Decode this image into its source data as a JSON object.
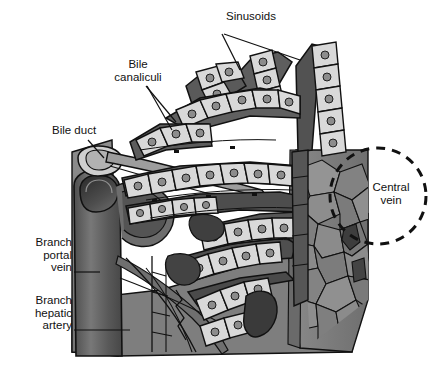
{
  "figure": {
    "type": "anatomical-diagram",
    "style": "grayscale line illustration",
    "background_color": "#ffffff"
  },
  "palette": {
    "background": "#ffffff",
    "outline": "#111111",
    "hepatocyte_fill": "#d9d9d9",
    "hepatocyte_nucleus": "#8f8f8f",
    "sinusoid_dark": "#5f5f5f",
    "sinusoid_darker": "#3f3f3f",
    "vessel_dark": "#4a4a4a",
    "vessel_mid": "#6e6e6e",
    "vessel_light": "#9a9a9a",
    "cut_face_gray": "#878787",
    "top_face_gray": "#a5a5a5",
    "bile_duct_fill": "#c9c9c9",
    "label_text": "#111111"
  },
  "labels": [
    {
      "id": "sinusoids",
      "text": "Sinusoids",
      "align": "center",
      "leaders": 2,
      "points_to": "dark channels between hepatocyte plates, upper right"
    },
    {
      "id": "bile-canaliculi",
      "text": "Bile\ncanaliculi",
      "align": "center",
      "leaders": 2,
      "points_to": "thin grooves between hepatocyte rows, upper middle"
    },
    {
      "id": "bile-duct",
      "text": "Bile duct",
      "align": "left",
      "leaders": 1,
      "points_to": "small pale tube at upper left of block"
    },
    {
      "id": "branch-portal-vein",
      "text": "Branch\nportal\nvein",
      "align": "right",
      "leaders": 1,
      "points_to": "large dark vertical vessel at left of block"
    },
    {
      "id": "branch-hepatic-artery",
      "text": "Branch\nhepatic\nartery",
      "align": "right",
      "leaders": 1,
      "points_to": "lower portion of left vessel bundle"
    },
    {
      "id": "central-vein",
      "text": "Central\nvein",
      "align": "center",
      "leaders": 0,
      "annotation": "dashed circle highlight at right edge of block"
    }
  ],
  "annotations": {
    "dashed_circle": {
      "name": "central-vein-highlight",
      "shape": "circle",
      "stroke": "#111111",
      "dash": "9 7",
      "stroke_width": 3
    }
  }
}
